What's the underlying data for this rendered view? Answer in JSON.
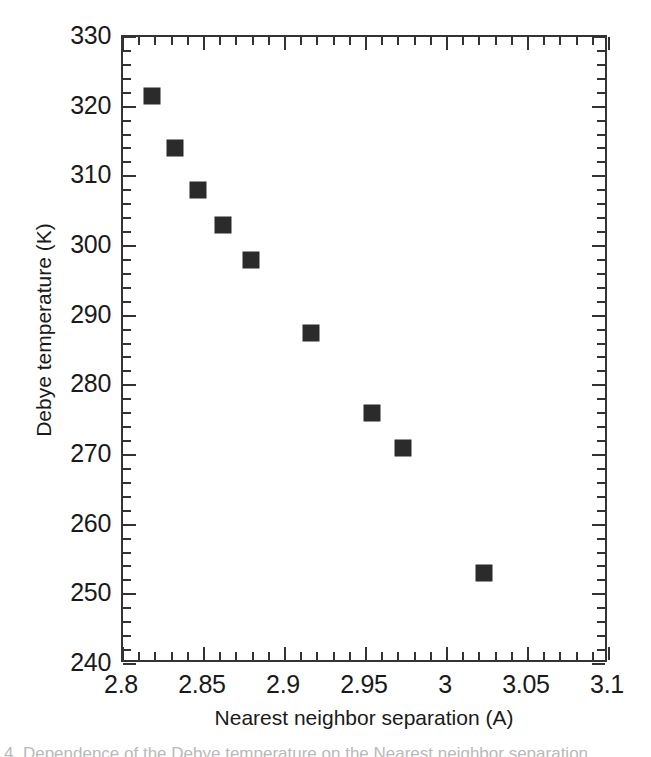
{
  "figure": {
    "background_color": "#ffffff",
    "frame_color": "#333333",
    "marker_color": "#2b2b2b",
    "caption_fragment": "4.  Dependence of the Debye temperature on the Nearest neighbor separation"
  },
  "chart_data": {
    "type": "scatter",
    "title": "",
    "xlabel": "Nearest neighbor separation (A)",
    "ylabel": "Debye temperature (K)",
    "xlim": [
      2.8,
      3.1
    ],
    "ylim": [
      240,
      330
    ],
    "grid": false,
    "legend": false,
    "x_major_ticks": [
      2.8,
      2.85,
      2.9,
      2.95,
      3.0,
      3.05,
      3.1
    ],
    "x_major_tick_labels": [
      "2.8",
      "2.85",
      "2.9",
      "2.95",
      "3",
      "3.05",
      "3.1"
    ],
    "x_minor_tick_step": 0.01,
    "y_major_ticks": [
      240,
      250,
      260,
      270,
      280,
      290,
      300,
      310,
      320,
      330
    ],
    "y_major_tick_labels": [
      "240",
      "250",
      "260",
      "270",
      "280",
      "290",
      "300",
      "310",
      "320",
      "330"
    ],
    "y_minor_tick_step": 2,
    "marker_style": "filled-square",
    "series": [
      {
        "name": "Debye temperature vs nearest neighbor separation",
        "points": [
          {
            "x": 2.818,
            "y": 321.5
          },
          {
            "x": 2.832,
            "y": 314.0
          },
          {
            "x": 2.846,
            "y": 308.0
          },
          {
            "x": 2.862,
            "y": 303.0
          },
          {
            "x": 2.879,
            "y": 298.0
          },
          {
            "x": 2.916,
            "y": 287.5
          },
          {
            "x": 2.954,
            "y": 276.0
          },
          {
            "x": 2.973,
            "y": 271.0
          },
          {
            "x": 3.023,
            "y": 253.0
          }
        ]
      }
    ]
  }
}
